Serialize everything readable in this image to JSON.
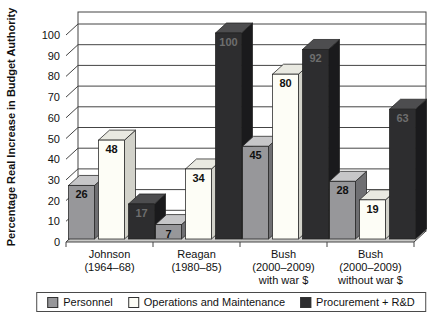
{
  "chart_data": {
    "type": "bar",
    "title": "",
    "ylabel": "Percentage Real Increase in Budget Authority",
    "xlabel": "",
    "ylim": [
      0,
      100
    ],
    "ytick_step": 10,
    "grid": true,
    "legend_position": "bottom",
    "style": "3d-clustered-column",
    "categories": [
      [
        "Johnson",
        "(1964–68)"
      ],
      [
        "Reagan",
        "(1980–85)"
      ],
      [
        "Bush",
        "(2000–2009)",
        "with war $"
      ],
      [
        "Bush",
        "(2000–2009)",
        "without war $"
      ]
    ],
    "series": [
      {
        "name": "Personnel",
        "values": [
          26,
          7,
          45,
          28
        ],
        "color_front": "#97979a",
        "color_top": "#c6c6c8",
        "color_side": "#6f6f72",
        "label_color": "#111111"
      },
      {
        "name": "Operations and Maintenance",
        "values": [
          48,
          34,
          80,
          19
        ],
        "color_front": "#fdfdf6",
        "color_top": "#e9e9e1",
        "color_side": "#d2d2ca",
        "label_color": "#111111"
      },
      {
        "name": "Procurement + R&D",
        "values": [
          17,
          100,
          92,
          63
        ],
        "color_front": "#2d2d2f",
        "color_top": "#4d4d4f",
        "color_side": "#1a1a1c",
        "label_color": "#6e6e6e"
      }
    ],
    "colors": {
      "background": "#ffffff",
      "floor": "#c9c9c7",
      "grid": "#444444",
      "axis_text": "#111111"
    }
  }
}
